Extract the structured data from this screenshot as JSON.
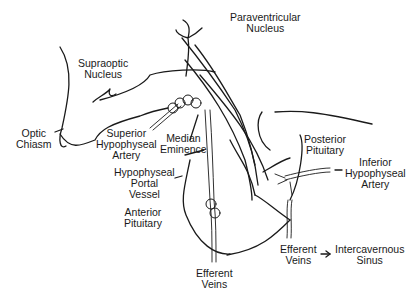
{
  "diagram": {
    "labels": {
      "paraventricular": [
        "Paraventricular",
        "Nucleus"
      ],
      "supraoptic": [
        "Supraoptic",
        "Nucleus"
      ],
      "optic_chiasm": [
        "Optic",
        "Chiasm"
      ],
      "superior_artery": [
        "Superior",
        "Hypophyseal",
        "Artery"
      ],
      "median_eminence": [
        "Median",
        "Eminence"
      ],
      "portal_vessel": [
        "Hypophyseal",
        "Portal",
        "Vessel"
      ],
      "anterior_pituitary": [
        "Anterior",
        "Pituitary"
      ],
      "posterior_pituitary": [
        "Posterior",
        "Pituitary"
      ],
      "inferior_artery": [
        "Inferior",
        "Hypophyseal",
        "Artery"
      ],
      "efferent_veins_bottom": [
        "Efferent",
        "Veins"
      ],
      "efferent_veins_right": [
        "Efferent",
        "Veins"
      ],
      "intercavernous_sinus": [
        "Intercavernous",
        "Sinus"
      ]
    },
    "line_color": "#1a1a1a"
  }
}
